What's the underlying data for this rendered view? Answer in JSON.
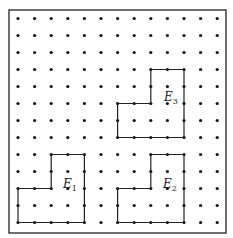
{
  "grid": {
    "cols": 13,
    "rows": 13,
    "origin_x": 18,
    "origin_y": 18.5,
    "spacing_x": 16.6,
    "spacing_y": 17,
    "dot_color": "#111111"
  },
  "frame": {
    "x": 9,
    "y": 10,
    "width": 217,
    "height": 223,
    "color": "#222222"
  },
  "shapes": [
    {
      "id": "E1",
      "label": "E",
      "subscript": "1",
      "label_pos": [
        63,
        188
      ],
      "vertices": [
        [
          0,
          10
        ],
        [
          2,
          10
        ],
        [
          2,
          8
        ],
        [
          4,
          8
        ],
        [
          4,
          12
        ],
        [
          0,
          12
        ]
      ]
    },
    {
      "id": "E2",
      "label": "E",
      "subscript": "2",
      "label_pos": [
        163,
        188
      ],
      "vertices": [
        [
          6,
          10
        ],
        [
          8,
          10
        ],
        [
          8,
          8
        ],
        [
          10,
          8
        ],
        [
          10,
          12
        ],
        [
          6,
          12
        ]
      ]
    },
    {
      "id": "E3",
      "label": "E",
      "subscript": "3",
      "label_pos": [
        164,
        101
      ],
      "vertices": [
        [
          8,
          3
        ],
        [
          10,
          3
        ],
        [
          10,
          7
        ],
        [
          6,
          7
        ],
        [
          6,
          5
        ],
        [
          8,
          5
        ]
      ]
    }
  ]
}
